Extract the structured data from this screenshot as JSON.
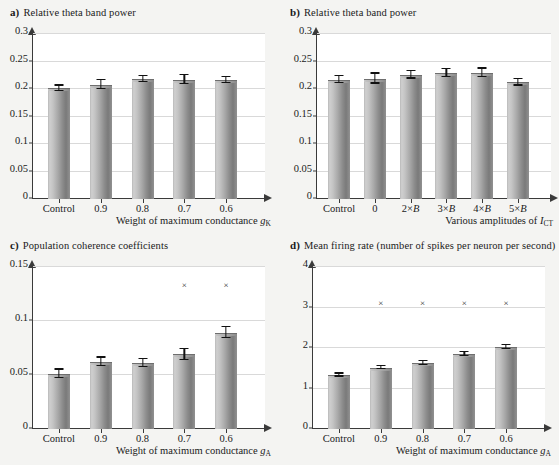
{
  "figure": {
    "background": "#f4f4f2",
    "bar_color_light": "#cfcfcf",
    "bar_color_dark": "#7a7a7a",
    "grid_color": "#d9d9d9",
    "axis_color": "#3a3a3a"
  },
  "panels": {
    "a": {
      "label": "a)",
      "title": "Relative theta band power",
      "xlabel_prefix": "Weight of maximum conductance ",
      "xlabel_sym": "g",
      "xlabel_sub": "K"
    },
    "b": {
      "label": "b)",
      "title": "Relative theta band power",
      "xlabel_prefix": "Various amplitudes of ",
      "xlabel_sym": "I",
      "xlabel_sub": "CT"
    },
    "c": {
      "label": "c)",
      "title": "Population coherence coefficients",
      "xlabel_prefix": "Weight of maximum conductance ",
      "xlabel_sym": "g",
      "xlabel_sub": "A"
    },
    "d": {
      "label": "d)",
      "title": "Mean firing rate (number of spikes per neuron per second)",
      "xlabel_prefix": "Weight of maximum conductance ",
      "xlabel_sym": "g",
      "xlabel_sub": "A"
    }
  },
  "chart_data": [
    {
      "panel": "a",
      "type": "bar",
      "title": "Relative theta band power",
      "xlabel": "Weight of maximum conductance gK",
      "ylabel": "",
      "categories": [
        "Control",
        "0.9",
        "0.8",
        "0.7",
        "0.6"
      ],
      "values": [
        0.201,
        0.208,
        0.218,
        0.217,
        0.216
      ],
      "errors": [
        0.005,
        0.008,
        0.006,
        0.008,
        0.005
      ],
      "ylim": [
        0,
        0.3
      ],
      "yticks": [
        "0",
        "0.05",
        "0.1",
        "0.15",
        "0.2",
        "0.25",
        "0.3"
      ],
      "ytick_values": [
        0,
        0.05,
        0.1,
        0.15,
        0.2,
        0.25,
        0.3
      ],
      "grid": true,
      "legend": "none",
      "significance_markers": []
    },
    {
      "panel": "b",
      "type": "bar",
      "title": "Relative theta band power",
      "xlabel": "Various amplitudes of ICT",
      "ylabel": "",
      "categories": [
        "Control",
        "0",
        "2×B",
        "3×B",
        "4×B",
        "5×B"
      ],
      "values": [
        0.217,
        0.219,
        0.226,
        0.229,
        0.229,
        0.212
      ],
      "errors": [
        0.006,
        0.009,
        0.007,
        0.007,
        0.008,
        0.006
      ],
      "ylim": [
        0,
        0.3
      ],
      "yticks": [
        "0",
        "0.05",
        "0.1",
        "0.15",
        "0.2",
        "0.25",
        "0.3"
      ],
      "ytick_values": [
        0,
        0.05,
        0.1,
        0.15,
        0.2,
        0.25,
        0.3
      ],
      "grid": true,
      "legend": "none",
      "significance_markers": []
    },
    {
      "panel": "c",
      "type": "bar",
      "title": "Population coherence coefficients",
      "xlabel": "Weight of maximum conductance gA",
      "ylabel": "",
      "categories": [
        "Control",
        "0.9",
        "0.8",
        "0.7",
        "0.6"
      ],
      "values": [
        0.051,
        0.062,
        0.061,
        0.069,
        0.089
      ],
      "errors": [
        0.004,
        0.004,
        0.004,
        0.005,
        0.005
      ],
      "ylim": [
        0,
        0.15
      ],
      "yticks": [
        "0",
        "0.05",
        "0.1",
        "0.15"
      ],
      "ytick_values": [
        0,
        0.05,
        0.1,
        0.15
      ],
      "grid": true,
      "legend": "none",
      "significance_markers": [
        {
          "category": "0.7",
          "y": 0.129,
          "glyph": "×"
        },
        {
          "category": "0.6",
          "y": 0.129,
          "glyph": "×"
        }
      ]
    },
    {
      "panel": "d",
      "type": "bar",
      "title": "Mean firing rate (number of spikes per neuron per second)",
      "xlabel": "Weight of maximum conductance gA",
      "ylabel": "",
      "categories": [
        "Control",
        "0.9",
        "0.8",
        "0.7",
        "0.6"
      ],
      "values": [
        1.33,
        1.51,
        1.63,
        1.85,
        2.02
      ],
      "errors": [
        0.04,
        0.04,
        0.05,
        0.05,
        0.05
      ],
      "ylim": [
        0,
        4
      ],
      "yticks": [
        "0",
        "1",
        "2",
        "3",
        "4"
      ],
      "ytick_values": [
        0,
        1,
        2,
        3,
        4
      ],
      "grid": true,
      "legend": "none",
      "significance_markers": [
        {
          "category": "0.9",
          "y": 3.0,
          "glyph": "×"
        },
        {
          "category": "0.8",
          "y": 3.0,
          "glyph": "×"
        },
        {
          "category": "0.7",
          "y": 3.0,
          "glyph": "×"
        },
        {
          "category": "0.6",
          "y": 3.0,
          "glyph": "×"
        }
      ]
    }
  ]
}
